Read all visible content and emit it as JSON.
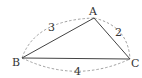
{
  "diagram": {
    "vertices": {
      "A": {
        "label": "A",
        "x": 94,
        "y": 18
      },
      "B": {
        "label": "B",
        "x": 22,
        "y": 58
      },
      "C": {
        "label": "C",
        "x": 130,
        "y": 59
      }
    },
    "sides": {
      "AB": {
        "label": "3"
      },
      "AC": {
        "label": "2"
      },
      "BC": {
        "label": "4"
      }
    },
    "colors": {
      "line": "#444444",
      "dashed": "#888888",
      "text": "#333333"
    }
  }
}
